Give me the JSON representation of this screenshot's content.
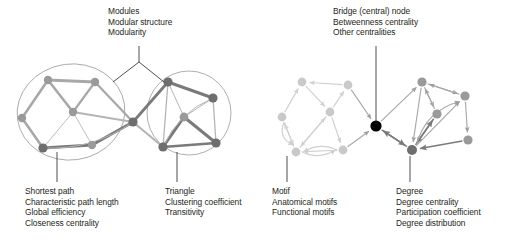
{
  "figure": {
    "title_alt": "Graph theory measures illustrated on two schematic brain networks",
    "background_color": "#ffffff",
    "text_color": "#231f20",
    "width": 508,
    "height": 243
  },
  "palette": {
    "node_mid_gray": "#9a9a9a",
    "node_dark_gray": "#6e6e6e",
    "node_light_gray": "#c9c9c9",
    "node_black": "#000000",
    "edge_thick_gray": "#a8a8a8",
    "edge_thin_gray": "#b5b5b5",
    "edge_dark_gray": "#7a7a7a",
    "edge_light_gray": "#d0d0d0",
    "module_outline": "#8d8d8d",
    "leader_line": "#231f20"
  },
  "annotations": [
    {
      "id": "modules",
      "name": "modules-annotation",
      "x": 108,
      "y": 6,
      "lines": [
        "Modules",
        "Modular structure",
        "Modularity"
      ],
      "leader": "fork"
    },
    {
      "id": "bridge",
      "name": "bridge-annotation",
      "x": 333,
      "y": 6,
      "lines": [
        "Bridge (central) node",
        "Betweenness centrality",
        "Other centralities"
      ],
      "leader": "vertical"
    },
    {
      "id": "shortest-path",
      "name": "shortest-path-annotation",
      "x": 25,
      "y": 186,
      "lines": [
        "Shortest path",
        "Characteristic path length",
        "Global efficiency",
        "Closeness centrality"
      ],
      "leader": "vertical"
    },
    {
      "id": "triangle",
      "name": "triangle-annotation",
      "x": 165,
      "y": 186,
      "lines": [
        "Triangle",
        "Clustering coefficient",
        "Transitivity"
      ],
      "leader": "vertical"
    },
    {
      "id": "motif",
      "name": "motif-annotation",
      "x": 272,
      "y": 186,
      "lines": [
        "Motif",
        "Anatomical motifs",
        "Functional motifs"
      ],
      "leader": "vertical"
    },
    {
      "id": "degree",
      "name": "degree-annotation",
      "x": 396,
      "y": 186,
      "lines": [
        "Degree",
        "Degree centrality",
        "Participation coefficient",
        "Degree distribution"
      ],
      "leader": "vertical"
    }
  ],
  "leaders": [
    {
      "name": "leader-modules-stem",
      "x1": 139,
      "y1": 46,
      "x2": 139,
      "y2": 62
    },
    {
      "name": "leader-modules-left-branch",
      "x1": 139,
      "y1": 62,
      "x2": 113,
      "y2": 82
    },
    {
      "name": "leader-modules-right-branch",
      "x1": 139,
      "y1": 62,
      "x2": 164,
      "y2": 82
    },
    {
      "name": "leader-bridge",
      "x1": 376,
      "y1": 46,
      "x2": 376,
      "y2": 124
    },
    {
      "name": "leader-shortest-path",
      "x1": 57,
      "y1": 152,
      "x2": 57,
      "y2": 182
    },
    {
      "name": "leader-triangle",
      "x1": 177,
      "y1": 152,
      "x2": 177,
      "y2": 182
    },
    {
      "name": "leader-motif",
      "x1": 287,
      "y1": 156,
      "x2": 287,
      "y2": 182
    },
    {
      "name": "leader-degree",
      "x1": 410,
      "y1": 156,
      "x2": 410,
      "y2": 182
    }
  ],
  "network_left": {
    "name": "modular-undirected-network",
    "modules": [
      {
        "name": "module-outline-left",
        "cx": 71,
        "cy": 112,
        "rx": 54,
        "ry": 48,
        "rotate": -8
      },
      {
        "name": "module-outline-right",
        "cx": 189,
        "cy": 113,
        "rx": 42,
        "ry": 42,
        "rotate": 0
      }
    ],
    "nodes": [
      {
        "id": "L1",
        "x": 48,
        "y": 80,
        "r": 4.2,
        "tone": "mid"
      },
      {
        "id": "L2",
        "x": 95,
        "y": 82,
        "r": 4.2,
        "tone": "mid"
      },
      {
        "id": "L3",
        "x": 22,
        "y": 118,
        "r": 4.2,
        "tone": "mid"
      },
      {
        "id": "L4",
        "x": 73,
        "y": 112,
        "r": 4.2,
        "tone": "mid"
      },
      {
        "id": "L5",
        "x": 43,
        "y": 148,
        "r": 4.6,
        "tone": "dark"
      },
      {
        "id": "L6",
        "x": 92,
        "y": 145,
        "r": 4.2,
        "tone": "mid"
      },
      {
        "id": "L7",
        "x": 133,
        "y": 122,
        "r": 4.6,
        "tone": "dark"
      },
      {
        "id": "R1",
        "x": 168,
        "y": 82,
        "r": 4.6,
        "tone": "dark"
      },
      {
        "id": "R2",
        "x": 213,
        "y": 98,
        "r": 4.6,
        "tone": "dark"
      },
      {
        "id": "R3",
        "x": 184,
        "y": 117,
        "r": 4.4,
        "tone": "mid"
      },
      {
        "id": "R4",
        "x": 163,
        "y": 147,
        "r": 4.6,
        "tone": "dark"
      },
      {
        "id": "R5",
        "x": 216,
        "y": 143,
        "r": 4.6,
        "tone": "dark"
      }
    ],
    "edges": [
      {
        "from": "L1",
        "to": "L2",
        "w": 3.0,
        "tone": "thick"
      },
      {
        "from": "L1",
        "to": "L3",
        "w": 2.6,
        "tone": "thick"
      },
      {
        "from": "L1",
        "to": "L4",
        "w": 2.6,
        "tone": "thick"
      },
      {
        "from": "L3",
        "to": "L5",
        "w": 2.6,
        "tone": "thick"
      },
      {
        "from": "L2",
        "to": "L4",
        "w": 2.2,
        "tone": "thick"
      },
      {
        "from": "L2",
        "to": "L7",
        "w": 2.2,
        "tone": "thick"
      },
      {
        "from": "L4",
        "to": "L5",
        "w": 0.9,
        "tone": "thin"
      },
      {
        "from": "L4",
        "to": "L6",
        "w": 0.9,
        "tone": "thin"
      },
      {
        "from": "L4",
        "to": "L7",
        "w": 1.8,
        "tone": "thin"
      },
      {
        "from": "L5",
        "to": "L6",
        "w": 3.0,
        "tone": "dark"
      },
      {
        "from": "L6",
        "to": "L7",
        "w": 2.8,
        "tone": "dark"
      },
      {
        "from": "L7",
        "to": "R1",
        "w": 2.8,
        "tone": "dark"
      },
      {
        "from": "L7",
        "to": "R4",
        "w": 2.2,
        "tone": "thin"
      },
      {
        "from": "R1",
        "to": "R2",
        "w": 3.0,
        "tone": "dark"
      },
      {
        "from": "R1",
        "to": "R3",
        "w": 1.0,
        "tone": "thin"
      },
      {
        "from": "R1",
        "to": "R4",
        "w": 1.3,
        "tone": "thin"
      },
      {
        "from": "R2",
        "to": "R3",
        "w": 1.0,
        "tone": "thin"
      },
      {
        "from": "R2",
        "to": "R5",
        "w": 1.3,
        "tone": "thin"
      },
      {
        "from": "R3",
        "to": "R4",
        "w": 3.0,
        "tone": "dark"
      },
      {
        "from": "R3",
        "to": "R5",
        "w": 3.0,
        "tone": "dark"
      },
      {
        "from": "R4",
        "to": "R5",
        "w": 2.4,
        "tone": "dark"
      }
    ],
    "curved_edges": [
      {
        "name": "shortest-path-arc",
        "from": "L5",
        "to": "L7",
        "bow": 16,
        "w": 1.0,
        "tone": "thin"
      },
      {
        "name": "triangle-arc",
        "from": "R4",
        "to": "R2",
        "bow": -14,
        "w": 1.0,
        "tone": "thin"
      }
    ]
  },
  "network_right": {
    "name": "directed-motif-network",
    "bridge_node_id": "B",
    "nodes": [
      {
        "id": "A1",
        "x": 302,
        "y": 82,
        "r": 4.4,
        "tone": "light"
      },
      {
        "id": "A2",
        "x": 348,
        "y": 85,
        "r": 4.4,
        "tone": "light"
      },
      {
        "id": "A3",
        "x": 282,
        "y": 117,
        "r": 4.4,
        "tone": "light"
      },
      {
        "id": "A4",
        "x": 330,
        "y": 112,
        "r": 4.4,
        "tone": "light"
      },
      {
        "id": "A5",
        "x": 296,
        "y": 152,
        "r": 4.4,
        "tone": "light"
      },
      {
        "id": "A6",
        "x": 343,
        "y": 150,
        "r": 4.4,
        "tone": "light"
      },
      {
        "id": "B",
        "x": 376,
        "y": 126,
        "r": 5.6,
        "tone": "black"
      },
      {
        "id": "C1",
        "x": 422,
        "y": 82,
        "r": 4.6,
        "tone": "mid"
      },
      {
        "id": "C2",
        "x": 465,
        "y": 96,
        "r": 4.6,
        "tone": "mid"
      },
      {
        "id": "C3",
        "x": 437,
        "y": 114,
        "r": 4.6,
        "tone": "mid"
      },
      {
        "id": "C4",
        "x": 412,
        "y": 150,
        "r": 5.0,
        "tone": "dark"
      },
      {
        "id": "C5",
        "x": 468,
        "y": 140,
        "r": 4.6,
        "tone": "mid"
      }
    ],
    "directed_edges": [
      {
        "from": "A2",
        "to": "A1",
        "tone": "light"
      },
      {
        "from": "A3",
        "to": "A1",
        "tone": "light"
      },
      {
        "from": "A1",
        "to": "A4",
        "tone": "light"
      },
      {
        "from": "A4",
        "to": "A2",
        "tone": "light"
      },
      {
        "from": "A4",
        "to": "A5",
        "tone": "light"
      },
      {
        "from": "A5",
        "to": "A4",
        "tone": "light"
      },
      {
        "from": "A4",
        "to": "A6",
        "tone": "light"
      },
      {
        "from": "A6",
        "to": "A5",
        "tone": "light"
      },
      {
        "from": "A5",
        "to": "A3",
        "tone": "light"
      },
      {
        "from": "A3",
        "to": "A5",
        "tone": "light"
      },
      {
        "from": "A2",
        "to": "B",
        "tone": "mid"
      },
      {
        "from": "A6",
        "to": "B",
        "tone": "mid"
      },
      {
        "from": "B",
        "to": "C1",
        "tone": "mid"
      },
      {
        "from": "B",
        "to": "C4",
        "tone": "dark"
      },
      {
        "from": "C4",
        "to": "B",
        "tone": "dark"
      },
      {
        "from": "C1",
        "to": "C2",
        "tone": "mid"
      },
      {
        "from": "C2",
        "to": "C1",
        "tone": "mid"
      },
      {
        "from": "C1",
        "to": "C3",
        "tone": "mid"
      },
      {
        "from": "C3",
        "to": "C1",
        "tone": "mid"
      },
      {
        "from": "C1",
        "to": "C4",
        "tone": "mid"
      },
      {
        "from": "C3",
        "to": "C4",
        "tone": "dark"
      },
      {
        "from": "C2",
        "to": "C5",
        "tone": "mid"
      },
      {
        "from": "C5",
        "to": "C4",
        "tone": "dark"
      },
      {
        "from": "C4",
        "to": "C2",
        "tone": "mid"
      },
      {
        "from": "C4",
        "to": "C3",
        "tone": "dark"
      }
    ],
    "curved_directed_edges": [
      {
        "name": "motif-arc-a3-a5",
        "from": "A3",
        "to": "A5",
        "bow": 12,
        "tone": "light"
      },
      {
        "name": "motif-arc-a5-a6",
        "from": "A5",
        "to": "A6",
        "bow": 9,
        "tone": "light"
      },
      {
        "name": "motif-arc-a6-a5",
        "from": "A6",
        "to": "A5",
        "bow": 9,
        "tone": "light"
      },
      {
        "name": "arc-c4-c2",
        "from": "C4",
        "to": "C2",
        "bow": -18,
        "tone": "mid"
      }
    ]
  }
}
